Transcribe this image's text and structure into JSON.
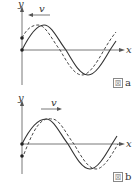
{
  "figures": [
    {
      "id": "a",
      "caption_prefix": "図",
      "caption_letter": "a",
      "axis_x_label": "x",
      "axis_y_label": "y",
      "velocity_label": "v",
      "velocity_direction": "left",
      "solid_wave": "sine starting at origin going up",
      "dashed_wave": "shifted left (leading in -x direction)"
    },
    {
      "id": "b",
      "caption_prefix": "図",
      "caption_letter": "b",
      "axis_x_label": "x",
      "axis_y_label": "y",
      "velocity_label": "v",
      "velocity_direction": "right",
      "solid_wave": "sine starting at origin going up",
      "dashed_wave": "shifted right (leading in +x direction)"
    }
  ],
  "colors": {
    "line": "#333333",
    "axis": "#555555",
    "dot": "#222222"
  }
}
